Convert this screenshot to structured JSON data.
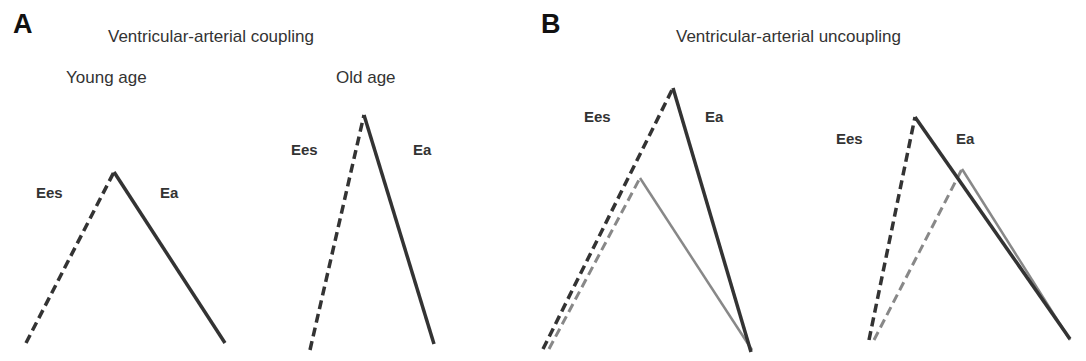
{
  "panels": {
    "a": {
      "letter": "A",
      "title": "Ventricular-arterial coupling",
      "young": {
        "subtitle": "Young age",
        "ees": "Ees",
        "ea": "Ea"
      },
      "old": {
        "subtitle": "Old age",
        "ees": "Ees",
        "ea": "Ea"
      }
    },
    "b": {
      "letter": "B",
      "title": "Ventricular-arterial uncoupling",
      "left": {
        "ees": "Ees",
        "ea": "Ea"
      },
      "right": {
        "ees": "Ees",
        "ea": "Ea"
      }
    }
  },
  "colors": {
    "dark": "#333333",
    "gray": "#888888"
  },
  "legend": {
    "dashed_line": "Ees (end-systolic elastance)",
    "solid_line": "Ea (arterial elastance)"
  }
}
